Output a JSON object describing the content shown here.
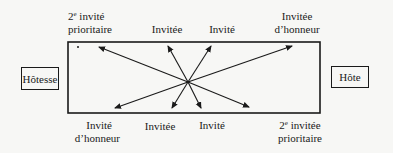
{
  "diagram": {
    "type": "seating-plan",
    "table": {
      "shape": "rectangle"
    },
    "ends": {
      "left": {
        "label": "Hôtesse"
      },
      "right": {
        "label": "Hôte"
      }
    },
    "top_side": [
      {
        "line1_prefix": "2",
        "line1_sup": "e",
        "line1_suffix": " invité",
        "line2": "prioritaire"
      },
      {
        "line1": "Invitée"
      },
      {
        "line1": "Invité"
      },
      {
        "line1": "Invitée",
        "line2": "d’honneur"
      }
    ],
    "bottom_side": [
      {
        "line1": "Invité",
        "line2": "d’honneur"
      },
      {
        "line1": "Invitée"
      },
      {
        "line1": "Invité"
      },
      {
        "line1_prefix": "2",
        "line1_sup": "e",
        "line1_suffix": " invitée",
        "line2": "prioritaire"
      }
    ],
    "arrows": {
      "origin": "center",
      "count": 8,
      "color": "#1a1a1a"
    }
  }
}
